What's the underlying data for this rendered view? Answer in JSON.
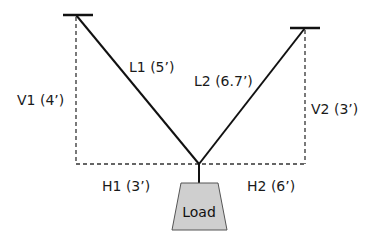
{
  "diagram": {
    "type": "cable-load statics",
    "labels": {
      "l1": "L1 (5’)",
      "l2": "L2 (6.7’)",
      "v1": "V1 (4’)",
      "v2": "V2 (3’)",
      "h1": "H1 (3’)",
      "h2": "H2 (6’)",
      "load": "Load"
    },
    "members": [
      {
        "id": "L1",
        "length_ft": 5,
        "kind": "cable"
      },
      {
        "id": "L2",
        "length_ft": 6.7,
        "kind": "cable"
      }
    ],
    "dimensions": [
      {
        "id": "V1",
        "value_ft": 4,
        "orientation": "vertical"
      },
      {
        "id": "V2",
        "value_ft": 3,
        "orientation": "vertical"
      },
      {
        "id": "H1",
        "value_ft": 3,
        "orientation": "horizontal"
      },
      {
        "id": "H2",
        "value_ft": 6,
        "orientation": "horizontal"
      }
    ],
    "colors": {
      "line": "#111111",
      "dashed": "#333333",
      "load_fill": "#cfcfcf",
      "load_stroke": "#555555",
      "background": "#ffffff"
    }
  }
}
